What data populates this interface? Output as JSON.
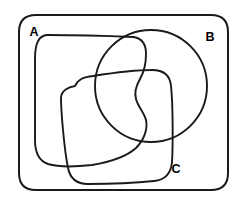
{
  "diagram": {
    "type": "venn-diagram",
    "background_color": "#ffffff",
    "stroke_color": "#1a1a1a",
    "universe": {
      "name": "universal-set",
      "shape": "rounded-rectangle",
      "bounds": {
        "x": 19,
        "y": 15,
        "width": 209,
        "height": 175
      },
      "corner_radius": 17
    },
    "sets": [
      {
        "id": "A",
        "label": "A",
        "shape": "rounded-square",
        "label_position": {
          "x": 34,
          "y": 33
        },
        "approx_bounds": {
          "x": 35,
          "y": 34,
          "width": 112,
          "height": 133
        }
      },
      {
        "id": "B",
        "label": "B",
        "shape": "circle",
        "label_position": {
          "x": 210,
          "y": 38
        },
        "center": {
          "x": 151,
          "y": 86
        },
        "radius": 56
      },
      {
        "id": "C",
        "label": "C",
        "shape": "rotated-rounded-square",
        "label_position": {
          "x": 176,
          "y": 170
        },
        "approx_bounds": {
          "x": 61,
          "y": 70,
          "width": 112,
          "height": 114
        }
      }
    ],
    "labels": {
      "a": "A",
      "b": "B",
      "c": "C"
    }
  }
}
